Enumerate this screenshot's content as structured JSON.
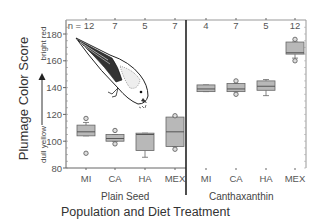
{
  "chart_data": {
    "type": "box",
    "title": "",
    "xlabel": "Population and Diet Treatment",
    "ylabel": "Plumage Color Score",
    "ylabel_low": "dull yellow",
    "ylabel_high": "bright red",
    "ylim": [
      80,
      185
    ],
    "yticks": [
      80,
      100,
      120,
      140,
      160,
      180
    ],
    "groups": [
      {
        "name": "Plain Seed",
        "categories": [
          "MI",
          "CA",
          "HA",
          "MEX"
        ],
        "n": [
          "n = 12",
          "7",
          "5",
          "7"
        ],
        "boxes": [
          {
            "q1": 104,
            "median": 107,
            "q3": 112,
            "whisker_low": 104,
            "whisker_high": 114,
            "outliers": [
              91,
              117
            ]
          },
          {
            "q1": 100,
            "median": 102,
            "q3": 105,
            "whisker_low": 100,
            "whisker_high": 105,
            "outliers": [
              98,
              108
            ]
          },
          {
            "q1": 93,
            "median": 105,
            "q3": 106,
            "whisker_low": 88,
            "whisker_high": 106,
            "outliers": []
          },
          {
            "q1": 96,
            "median": 107,
            "q3": 118,
            "whisker_low": 96,
            "whisker_high": 118,
            "outliers": [
              94,
              119
            ]
          }
        ]
      },
      {
        "name": "Canthaxanthin",
        "categories": [
          "MI",
          "CA",
          "HA",
          "MEX"
        ],
        "n": [
          "4",
          "7",
          "5",
          "12"
        ],
        "boxes": [
          {
            "q1": 137,
            "median": 139,
            "q3": 142,
            "whisker_low": 137,
            "whisker_high": 142,
            "outliers": []
          },
          {
            "q1": 137,
            "median": 139,
            "q3": 143,
            "whisker_low": 137,
            "whisker_high": 143,
            "outliers": [
              135,
              145
            ]
          },
          {
            "q1": 138,
            "median": 141,
            "q3": 145,
            "whisker_low": 134,
            "whisker_high": 146,
            "outliers": []
          },
          {
            "q1": 165,
            "median": 166,
            "q3": 174,
            "whisker_low": 162,
            "whisker_high": 174,
            "outliers": [
              176,
              160
            ]
          }
        ]
      }
    ],
    "legend": null,
    "grid": false,
    "annotation": "bird illustration"
  },
  "labels": {
    "xlabel": "Population and Diet Treatment",
    "ylabel": "Plumage Color Score",
    "ylabel_low": "dull yellow",
    "ylabel_high": "bright red",
    "group1": "Plain Seed",
    "group2": "Canthaxanthin"
  }
}
